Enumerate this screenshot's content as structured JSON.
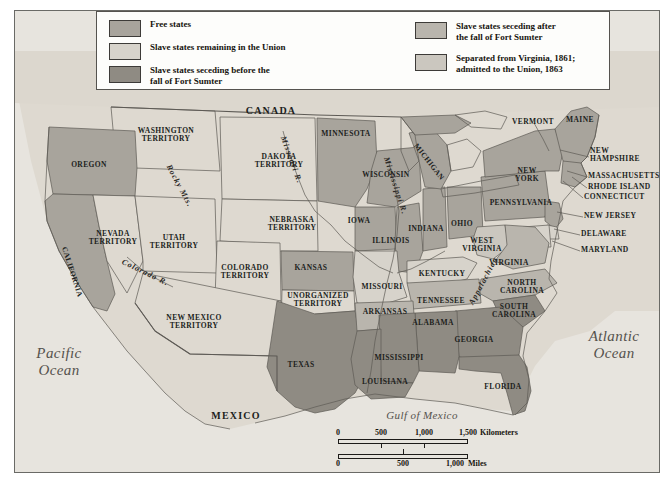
{
  "map": {
    "title": "United States on the eve of the Civil War",
    "legend": {
      "items_left": [
        {
          "label": "Free states",
          "color": "#a8a49c"
        },
        {
          "label": "Slave states remaining in the Union",
          "color": "#d7d3cb"
        },
        {
          "label": "Slave states seceding before the\nfall of Fort Sumter",
          "color": "#8f8b83"
        }
      ],
      "items_right": [
        {
          "label": "Slave states seceding after\nthe fall of Fort Sumter",
          "color": "#b9b5ad"
        },
        {
          "label": "Separated from Virginia, 1861;\nadmitted to the Union, 1863",
          "color": "#cbc7bf"
        }
      ]
    },
    "countries": [
      {
        "name": "CANADA",
        "x": 257,
        "y": 101
      },
      {
        "name": "MEXICO",
        "x": 222,
        "y": 406
      }
    ],
    "water_bodies": [
      {
        "name": "Pacific\nOcean",
        "x": 45,
        "y": 352,
        "size": "big"
      },
      {
        "name": "Atlantic\nOcean",
        "x": 600,
        "y": 335,
        "size": "big"
      },
      {
        "name": "Gulf of Mexico",
        "x": 408,
        "y": 406,
        "size": "mid"
      }
    ],
    "physical_features": [
      {
        "name": "Rocky Mts.",
        "x": 165,
        "y": 176,
        "rotate": 62
      },
      {
        "name": "Appalachian",
        "x": 470,
        "y": 271,
        "rotate": -62
      },
      {
        "name": "Missouri R.",
        "x": 277,
        "y": 150,
        "rotate": 70
      },
      {
        "name": "Mississippi R.",
        "x": 381,
        "y": 176,
        "rotate": 72
      },
      {
        "name": "Colorado R.",
        "x": 131,
        "y": 263,
        "rotate": 26
      }
    ],
    "states": [
      {
        "name": "OREGON",
        "x": 75,
        "y": 155,
        "cat": "free"
      },
      {
        "name": "WASHINGTON\nTERRITORY",
        "x": 152,
        "y": 125,
        "cat": "terr"
      },
      {
        "name": "CALIFORNIA",
        "x": 58,
        "y": 262,
        "cat": "free",
        "rotate": 72
      },
      {
        "name": "NEVADA\nTERRITORY",
        "x": 99,
        "y": 228,
        "cat": "terr"
      },
      {
        "name": "UTAH\nTERRITORY",
        "x": 160,
        "y": 232,
        "cat": "terr"
      },
      {
        "name": "DAKOTA\nTERRITORY",
        "x": 265,
        "y": 151,
        "cat": "terr"
      },
      {
        "name": "NEBRASKA\nTERRITORY",
        "x": 278,
        "y": 214,
        "cat": "terr"
      },
      {
        "name": "COLORADO\nTERRITORY",
        "x": 231,
        "y": 262,
        "cat": "terr"
      },
      {
        "name": "KANSAS",
        "x": 297,
        "y": 258,
        "cat": "free"
      },
      {
        "name": "UNORGANIZED\nTERRITORY",
        "x": 304,
        "y": 290,
        "cat": "terr"
      },
      {
        "name": "NEW MEXICO\nTERRITORY",
        "x": 180,
        "y": 312,
        "cat": "terr"
      },
      {
        "name": "TEXAS",
        "x": 287,
        "y": 355,
        "cat": "sec-before"
      },
      {
        "name": "MINNESOTA",
        "x": 332,
        "y": 124,
        "cat": "free"
      },
      {
        "name": "WISCONSIN",
        "x": 372,
        "y": 165,
        "cat": "free"
      },
      {
        "name": "IOWA",
        "x": 345,
        "y": 211,
        "cat": "free"
      },
      {
        "name": "ILLINOIS",
        "x": 377,
        "y": 231,
        "cat": "free"
      },
      {
        "name": "MICHIGAN",
        "x": 415,
        "y": 152,
        "cat": "free",
        "rotate": 52
      },
      {
        "name": "INDIANA",
        "x": 412,
        "y": 219,
        "cat": "free"
      },
      {
        "name": "OHIO",
        "x": 448,
        "y": 214,
        "cat": "free"
      },
      {
        "name": "MISSOURI",
        "x": 368,
        "y": 277,
        "cat": "union-slave"
      },
      {
        "name": "ARKANSAS",
        "x": 371,
        "y": 302,
        "cat": "sec-after"
      },
      {
        "name": "KENTUCKY",
        "x": 428,
        "y": 264,
        "cat": "union-slave"
      },
      {
        "name": "TENNESSEE",
        "x": 427,
        "y": 291,
        "cat": "sec-after"
      },
      {
        "name": "MISSISSIPPI",
        "x": 385,
        "y": 348,
        "cat": "sec-before"
      },
      {
        "name": "ALABAMA",
        "x": 419,
        "y": 313,
        "cat": "sec-before"
      },
      {
        "name": "LOUISIANA",
        "x": 371,
        "y": 372,
        "cat": "sec-before"
      },
      {
        "name": "GEORGIA",
        "x": 460,
        "y": 330,
        "cat": "sec-before"
      },
      {
        "name": "FLORIDA",
        "x": 489,
        "y": 377,
        "cat": "sec-before"
      },
      {
        "name": "SOUTH\nCAROLINA",
        "x": 500,
        "y": 301,
        "cat": "sec-before"
      },
      {
        "name": "NORTH\nCAROLINA",
        "x": 508,
        "y": 277,
        "cat": "sec-after"
      },
      {
        "name": "VIRGINIA",
        "x": 495,
        "y": 253,
        "cat": "sec-after"
      },
      {
        "name": "WEST\nVIRGINIA",
        "x": 468,
        "y": 235,
        "cat": "wv"
      },
      {
        "name": "PENNSYLVANIA",
        "x": 507,
        "y": 193,
        "cat": "free"
      },
      {
        "name": "NEW\nYORK",
        "x": 513,
        "y": 165,
        "cat": "free"
      },
      {
        "name": "VERMONT",
        "x": 519,
        "y": 112,
        "cat": "free"
      },
      {
        "name": "MAINE",
        "x": 566,
        "y": 110,
        "cat": "free"
      }
    ],
    "callout_labels": [
      {
        "name": "NEW\nHAMPSHIRE",
        "x": 603,
        "y": 145,
        "lx": 574,
        "ly": 146,
        "tx": 545,
        "ty": 139
      },
      {
        "name": "MASSACHUSETTS",
        "x": 621,
        "y": 166,
        "lx": 572,
        "ly": 166,
        "tx": 552,
        "ty": 160
      },
      {
        "name": "RHODE ISLAND",
        "x": 617,
        "y": 177,
        "lx": 572,
        "ly": 177,
        "tx": 557,
        "ty": 166
      },
      {
        "name": "CONNECTICUT",
        "x": 613,
        "y": 187,
        "lx": 568,
        "ly": 187,
        "tx": 548,
        "ty": 170
      },
      {
        "name": "NEW JERSEY",
        "x": 607,
        "y": 206,
        "lx": 568,
        "ly": 206,
        "tx": 542,
        "ty": 201
      },
      {
        "name": "DELAWARE",
        "x": 604,
        "y": 224,
        "lx": 565,
        "ly": 224,
        "tx": 539,
        "ty": 218
      },
      {
        "name": "MARYLAND",
        "x": 604,
        "y": 240,
        "lx": 565,
        "ly": 240,
        "tx": 537,
        "ty": 230
      }
    ],
    "scale": {
      "km": {
        "unit": "Kilometers",
        "ticks": [
          "0",
          "500",
          "1,000",
          "1,500"
        ]
      },
      "mi": {
        "unit": "Miles",
        "ticks": [
          "0",
          "500",
          "1,000"
        ]
      }
    }
  }
}
